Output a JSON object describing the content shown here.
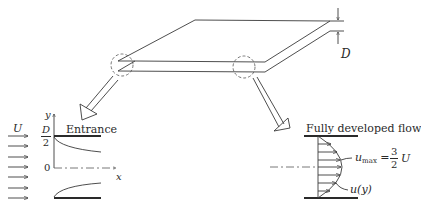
{
  "diagram": {
    "type": "channel-flow-development",
    "top_view": {
      "gap_label": "D"
    },
    "entrance_panel": {
      "title": "Entrance",
      "inflow_label": "U",
      "y_axis_label": "y",
      "x_axis_label": "x",
      "half_gap_numerator": "D",
      "half_gap_denominator": "2",
      "origin_label": "0",
      "inflow_arrow_count": 7
    },
    "developed_panel": {
      "title": "Fully developed flow",
      "umax_symbol": "u",
      "umax_sub": "max",
      "umax_eq": "=",
      "umax_frac_num": "3",
      "umax_frac_den": "2",
      "umax_tail": "U",
      "profile_label": "u(y)",
      "profile_arrow_count": 7
    },
    "colors": {
      "line": "#3a3a3a",
      "background": "#ffffff"
    }
  }
}
